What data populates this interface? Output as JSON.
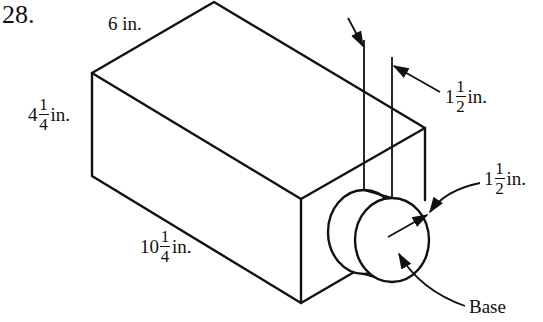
{
  "problem": {
    "number": "28."
  },
  "dimensions": {
    "width": {
      "text": "6 in."
    },
    "height": {
      "whole": "4",
      "num": "1",
      "den": "4",
      "unit": "in."
    },
    "length": {
      "whole": "10",
      "num": "1",
      "den": "4",
      "unit": "in."
    },
    "cylinder_length": {
      "whole": "1",
      "num": "1",
      "den": "2",
      "unit": "in."
    },
    "cylinder_radius": {
      "whole": "1",
      "num": "1",
      "den": "2",
      "unit": "in."
    }
  },
  "labels": {
    "base": "Base"
  },
  "colors": {
    "stroke": "#111111",
    "background": "#ffffff"
  }
}
